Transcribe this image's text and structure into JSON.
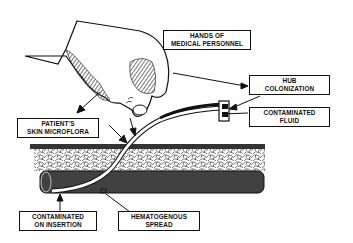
{
  "diagram": {
    "type": "illustration",
    "labels": {
      "hands": {
        "line1": "HANDS OF",
        "line2": "MEDICAL PERSONNEL"
      },
      "hub": {
        "line1": "HUB",
        "line2": "COLONIZATION"
      },
      "fluid": {
        "line1": "CONTAMINATED",
        "line2": "FLUID"
      },
      "skin": {
        "line1": "PATIENT'S",
        "line2": "SKIN MICROFLORA"
      },
      "insertion": {
        "line1": "CONTAMINATED",
        "line2": "ON INSERTION"
      },
      "hematogenous": {
        "line1": "HEMATOGENOUS",
        "line2": "SPREAD"
      }
    },
    "elements": [
      "hand-illustration",
      "catheter",
      "catheter-hub",
      "skin-tissue-layer",
      "blood-vessel"
    ],
    "colors": {
      "ink": "#111111",
      "background": "#ffffff"
    }
  }
}
